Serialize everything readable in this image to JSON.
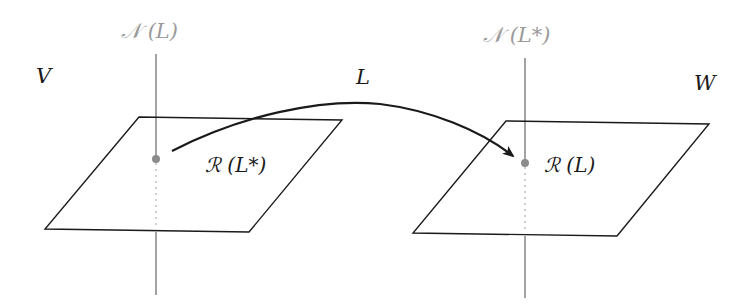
{
  "diagram": {
    "left_space": {
      "label": "V",
      "nullspace_label": "𝒩 (L)",
      "range_label": "ℛ (L*)"
    },
    "right_space": {
      "label": "W",
      "nullspace_label": "𝒩 (L*)",
      "range_label": "ℛ (L)"
    },
    "map_label": "L",
    "colors": {
      "line": "#1a1a1a",
      "axis": "#8c8c8c",
      "axis_label": "#9a9a9a"
    }
  }
}
